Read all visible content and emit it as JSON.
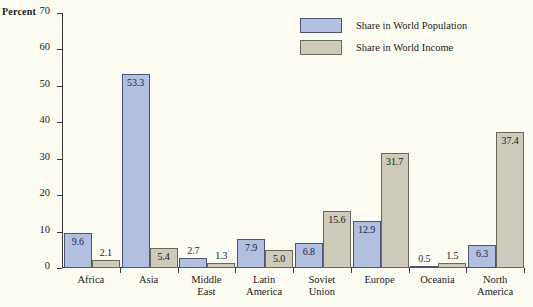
{
  "chart_data": {
    "type": "bar",
    "title": "",
    "xlabel": "",
    "ylabel": "Percent",
    "ylim": [
      0,
      70
    ],
    "yticks": [
      0,
      10,
      20,
      30,
      40,
      50,
      60,
      70
    ],
    "grid": false,
    "legend_position": "top-right",
    "categories": [
      "Africa",
      "Asia",
      "Middle\nEast",
      "Latin\nAmerica",
      "Soviet\nUnion",
      "Europe",
      "Oceania",
      "North\nAmerica"
    ],
    "series": [
      {
        "name": "Share in World Population",
        "color": "#b3bfdf",
        "values": [
          9.6,
          53.3,
          2.7,
          7.9,
          6.8,
          12.9,
          0.5,
          6.3
        ],
        "labels": [
          "9.6",
          "53.3",
          "2.7",
          "7.9",
          "6.8",
          "12.9",
          "0.5",
          "6.3"
        ]
      },
      {
        "name": "Share in World Income",
        "color": "#cecbbc",
        "values": [
          2.1,
          5.4,
          1.3,
          5.0,
          15.6,
          31.7,
          1.5,
          37.4
        ],
        "labels": [
          "2.1",
          "5.4",
          "1.3",
          "5.0",
          "15.6",
          "31.7",
          "1.5",
          "37.4"
        ]
      }
    ]
  },
  "axis": {
    "tick_labels": [
      "0",
      "10",
      "20",
      "30",
      "40",
      "50",
      "60",
      "70"
    ],
    "unit_caption": "Percent"
  },
  "legend": {
    "items": [
      {
        "label": "Share in World Population",
        "color": "#b3bfdf"
      },
      {
        "label": "Share in World Income",
        "color": "#cecbbc"
      }
    ]
  }
}
